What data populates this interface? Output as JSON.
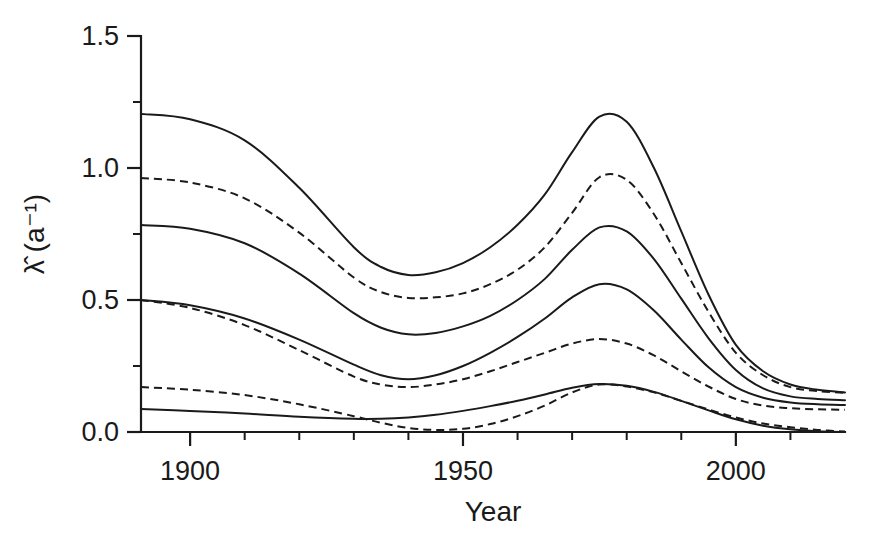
{
  "chart_data": {
    "type": "line",
    "title": "",
    "subtitle": "",
    "xlabel": "Year",
    "ylabel": "λ̂ (a⁻¹)",
    "xlim": [
      1891,
      2020
    ],
    "ylim": [
      0.0,
      1.5
    ],
    "grid": false,
    "legend": "none",
    "x_ticks_major": [
      1900,
      1950,
      2000
    ],
    "x_tick_labels": [
      "1900",
      "1950",
      "2000"
    ],
    "x_ticks_minor": [
      1910,
      1920,
      1930,
      1940,
      1960,
      1970,
      1980,
      1990,
      2010
    ],
    "y_ticks_major": [
      0.0,
      0.5,
      1.0,
      1.5
    ],
    "y_tick_labels": [
      "0.0",
      "0.5",
      "1.0",
      "1.5"
    ],
    "y_ticks_minor": [
      0.25,
      0.75,
      1.25
    ],
    "x": [
      1891,
      1900,
      1910,
      1920,
      1930,
      1935,
      1940,
      1945,
      1950,
      1955,
      1960,
      1965,
      1970,
      1975,
      1980,
      1985,
      1990,
      1995,
      2000,
      2005,
      2010,
      2015,
      2020
    ],
    "series": [
      {
        "name": "curve-1-solid-upper",
        "style": "solid",
        "values": [
          1.205,
          1.185,
          1.105,
          0.925,
          0.7,
          0.625,
          0.595,
          0.605,
          0.64,
          0.7,
          0.785,
          0.9,
          1.06,
          1.195,
          1.175,
          1.0,
          0.76,
          0.52,
          0.33,
          0.23,
          0.18,
          0.16,
          0.15
        ]
      },
      {
        "name": "curve-2-dashed-upper",
        "style": "dashed",
        "values": [
          0.962,
          0.945,
          0.885,
          0.755,
          0.585,
          0.53,
          0.508,
          0.51,
          0.525,
          0.56,
          0.615,
          0.7,
          0.83,
          0.965,
          0.955,
          0.825,
          0.64,
          0.455,
          0.3,
          0.215,
          0.17,
          0.155,
          0.148
        ]
      },
      {
        "name": "curve-3-solid-mid-upper",
        "style": "solid",
        "values": [
          0.784,
          0.77,
          0.715,
          0.6,
          0.45,
          0.395,
          0.37,
          0.375,
          0.4,
          0.44,
          0.5,
          0.58,
          0.69,
          0.775,
          0.76,
          0.655,
          0.505,
          0.355,
          0.235,
          0.165,
          0.135,
          0.125,
          0.12
        ]
      },
      {
        "name": "curve-4-solid-mid",
        "style": "solid",
        "values": [
          0.5,
          0.48,
          0.43,
          0.35,
          0.255,
          0.215,
          0.2,
          0.215,
          0.25,
          0.3,
          0.36,
          0.43,
          0.51,
          0.56,
          0.54,
          0.46,
          0.35,
          0.245,
          0.17,
          0.13,
          0.112,
          0.105,
          0.102
        ]
      },
      {
        "name": "curve-5-dashed-mid",
        "style": "dashed",
        "values": [
          0.5,
          0.47,
          0.405,
          0.31,
          0.21,
          0.18,
          0.17,
          0.18,
          0.2,
          0.23,
          0.265,
          0.3,
          0.335,
          0.352,
          0.335,
          0.29,
          0.23,
          0.172,
          0.125,
          0.1,
          0.09,
          0.086,
          0.084
        ]
      },
      {
        "name": "curve-6-dashed-lower",
        "style": "dashed",
        "values": [
          0.17,
          0.16,
          0.14,
          0.105,
          0.06,
          0.035,
          0.015,
          0.008,
          0.012,
          0.03,
          0.06,
          0.1,
          0.15,
          0.18,
          0.172,
          0.15,
          0.118,
          0.085,
          0.055,
          0.032,
          0.018,
          0.008,
          0.002
        ]
      },
      {
        "name": "curve-7-solid-lower",
        "style": "solid",
        "values": [
          0.087,
          0.08,
          0.07,
          0.058,
          0.05,
          0.05,
          0.055,
          0.065,
          0.08,
          0.098,
          0.118,
          0.142,
          0.168,
          0.182,
          0.175,
          0.152,
          0.118,
          0.082,
          0.048,
          0.024,
          0.01,
          0.003,
          0.0
        ]
      }
    ]
  },
  "axes": {
    "x_axis_name": "Year",
    "y_axis_name": "lambda-hat (a^-1)"
  }
}
